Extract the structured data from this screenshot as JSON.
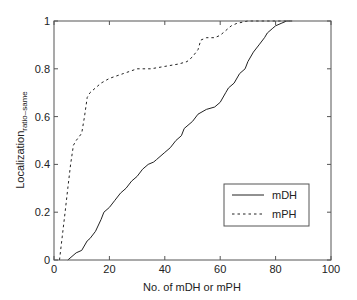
{
  "chart_data": {
    "type": "line",
    "title": "",
    "xlabel": "No. of mDH or mPH",
    "ylabel": "Localization",
    "ylabel_subscript": "ratio–same",
    "xlim": [
      0,
      100
    ],
    "ylim": [
      0,
      1
    ],
    "xticks": [
      0,
      20,
      40,
      60,
      80,
      100
    ],
    "yticks": [
      0,
      0.2,
      0.4,
      0.6,
      0.8,
      1
    ],
    "xtick_labels": [
      "0",
      "20",
      "40",
      "60",
      "80",
      "100"
    ],
    "ytick_labels": [
      "0",
      "0.2",
      "0.4",
      "0.6",
      "0.8",
      "1"
    ],
    "grid": false,
    "legend_position": "lower right",
    "series": [
      {
        "name": "mDH",
        "style": "solid",
        "color": "#222222",
        "x": [
          5,
          8,
          10,
          12,
          13,
          15,
          17,
          18,
          20,
          22,
          24,
          26,
          28,
          30,
          32,
          34,
          36,
          37,
          40,
          42,
          44,
          46,
          47,
          50,
          52,
          55,
          58,
          60,
          62,
          63,
          65,
          67,
          69,
          70,
          72,
          74,
          76,
          77,
          79,
          80,
          82,
          84,
          86
        ],
        "y": [
          0,
          0.03,
          0.04,
          0.08,
          0.09,
          0.12,
          0.17,
          0.2,
          0.22,
          0.25,
          0.28,
          0.3,
          0.33,
          0.35,
          0.38,
          0.4,
          0.41,
          0.42,
          0.45,
          0.47,
          0.5,
          0.52,
          0.55,
          0.58,
          0.61,
          0.63,
          0.64,
          0.66,
          0.7,
          0.72,
          0.74,
          0.78,
          0.8,
          0.83,
          0.87,
          0.9,
          0.93,
          0.95,
          0.97,
          0.98,
          0.99,
          1.0,
          1.0
        ]
      },
      {
        "name": "mPH",
        "style": "dashed",
        "color": "#222222",
        "x": [
          2,
          3,
          4,
          5,
          6,
          7,
          8,
          10,
          11,
          12,
          13,
          15,
          17,
          20,
          25,
          30,
          35,
          40,
          45,
          48,
          50,
          52,
          53,
          55,
          58,
          60,
          62,
          64,
          66,
          70,
          72,
          80,
          85
        ],
        "y": [
          0,
          0.1,
          0.2,
          0.3,
          0.4,
          0.48,
          0.5,
          0.53,
          0.6,
          0.68,
          0.7,
          0.72,
          0.74,
          0.76,
          0.78,
          0.8,
          0.8,
          0.81,
          0.82,
          0.83,
          0.85,
          0.88,
          0.92,
          0.93,
          0.93,
          0.94,
          0.96,
          0.98,
          0.99,
          1.0,
          1.0,
          1.0,
          1.0
        ]
      }
    ]
  },
  "legend": {
    "items": [
      {
        "label": "mDH",
        "style": "solid"
      },
      {
        "label": "mPH",
        "style": "dashed"
      }
    ]
  },
  "axes": {
    "xlabel": "No. of mDH or mPH",
    "ylabel_main": "Localization",
    "ylabel_sub": "ratio–same"
  }
}
